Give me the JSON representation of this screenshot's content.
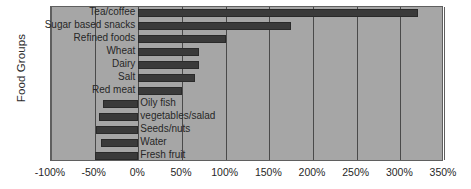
{
  "chart_data": {
    "type": "bar",
    "orientation": "horizontal",
    "title": "",
    "xlabel": "",
    "ylabel": "Food Groups",
    "xlim": [
      -100,
      350
    ],
    "xticks": [
      -100,
      -50,
      0,
      50,
      100,
      150,
      200,
      250,
      300,
      350
    ],
    "xticklabels": [
      "-100%",
      "-50%",
      "0%",
      "50%",
      "100%",
      "150%",
      "200%",
      "250%",
      "300%",
      "350%"
    ],
    "grid": true,
    "legend": null,
    "categories": [
      "Tea/coffee",
      "Sugar based snacks",
      "Refined foods",
      "Wheat",
      "Dairy",
      "Salt",
      "Red meat",
      "Oily fish",
      "vegetables/salad",
      "Seeds/nuts",
      "Water",
      "Fresh fruit"
    ],
    "values": [
      320,
      175,
      100,
      70,
      70,
      65,
      50,
      -40,
      -45,
      -48,
      -43,
      -50
    ],
    "bar_color": "#3a3a3a",
    "plot_background": "#a6a6a6"
  },
  "axis": {
    "y_title": "Food Groups"
  }
}
